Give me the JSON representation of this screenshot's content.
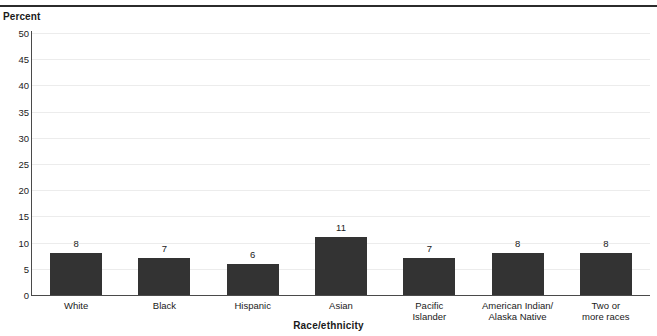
{
  "chart_data": {
    "type": "bar",
    "title": "",
    "subtitle": "",
    "xlabel": "Race/ethnicity",
    "ylabel": "Percent",
    "categories": [
      "White",
      "Black",
      "Hispanic",
      "Asian",
      "Pacific\nIslander",
      "American Indian/\nAlaska Native",
      "Two or\nmore races"
    ],
    "values": [
      8,
      7,
      6,
      11,
      7,
      8,
      8
    ],
    "data_labels": [
      "8",
      "7",
      "6",
      "11",
      "7",
      "8",
      "8"
    ],
    "ylim": [
      0,
      50
    ],
    "ytick_labels": [
      "50",
      "45",
      "40",
      "35",
      "30",
      "25",
      "20",
      "15",
      "10",
      "5",
      "0"
    ],
    "ytick_values": [
      50,
      45,
      40,
      35,
      30,
      25,
      20,
      15,
      10,
      5,
      0
    ],
    "grid": true,
    "grid_axis": "y",
    "legend": null,
    "bar_color": "#333333",
    "gridline_color": "#ececec",
    "axis_color": "#4a4a4a",
    "rule_color": "#2b2b2b"
  }
}
